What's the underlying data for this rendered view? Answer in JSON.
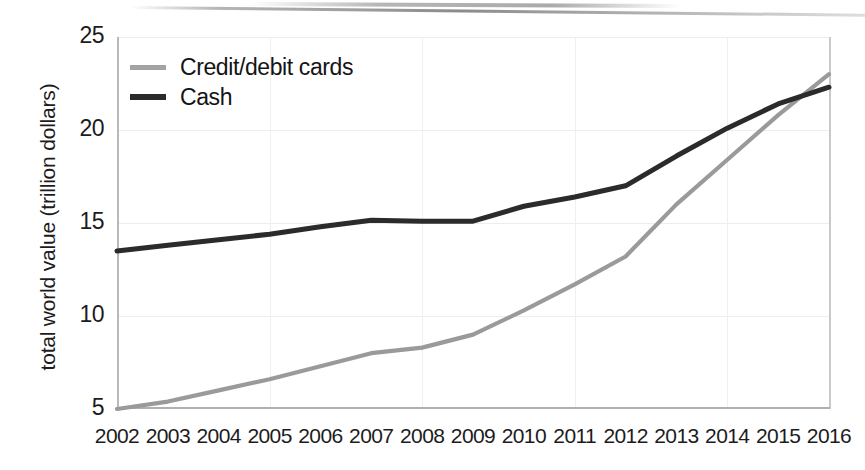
{
  "chart_data": {
    "type": "line",
    "title": "",
    "xlabel": "",
    "ylabel": "total world value (trillion dollars)",
    "x": [
      2002,
      2003,
      2004,
      2005,
      2006,
      2007,
      2008,
      2009,
      2010,
      2011,
      2012,
      2013,
      2014,
      2015,
      2016
    ],
    "xticklabels": [
      "2002",
      "2003",
      "2004",
      "2005",
      "2006",
      "2007",
      "2008",
      "2009",
      "2010",
      "2011",
      "2012",
      "2013",
      "2014",
      "2015",
      "2016"
    ],
    "yticklabels": [
      "5",
      "10",
      "15",
      "20",
      "25"
    ],
    "yticks": [
      5,
      10,
      15,
      20,
      25
    ],
    "xlim": [
      2002,
      2016
    ],
    "ylim": [
      5,
      25
    ],
    "grid": true,
    "legend_position": "top-left",
    "series": [
      {
        "name": "Credit/debit cards",
        "color": "#9a9a9a",
        "values": [
          5.0,
          5.4,
          6.0,
          6.6,
          7.3,
          8.0,
          8.3,
          9.0,
          10.3,
          11.7,
          13.2,
          16.0,
          18.4,
          20.8,
          23.0
        ]
      },
      {
        "name": "Cash",
        "color": "#2b2b2b",
        "values": [
          13.5,
          13.8,
          14.1,
          14.4,
          14.8,
          15.15,
          15.1,
          15.1,
          15.9,
          16.4,
          17.0,
          18.6,
          20.1,
          21.4,
          22.3
        ]
      }
    ]
  },
  "legend": {
    "items": [
      {
        "label": "Credit/debit cards",
        "swatch": "line-swatch-gray"
      },
      {
        "label": "Cash",
        "swatch": "line-swatch-dark"
      }
    ]
  },
  "colors": {
    "cards_line": "#9a9a9a",
    "cash_line": "#2b2b2b",
    "grid": "#ededed",
    "axis": "#b9b9b9",
    "text": "#1c1c1c",
    "background": "#ffffff"
  }
}
